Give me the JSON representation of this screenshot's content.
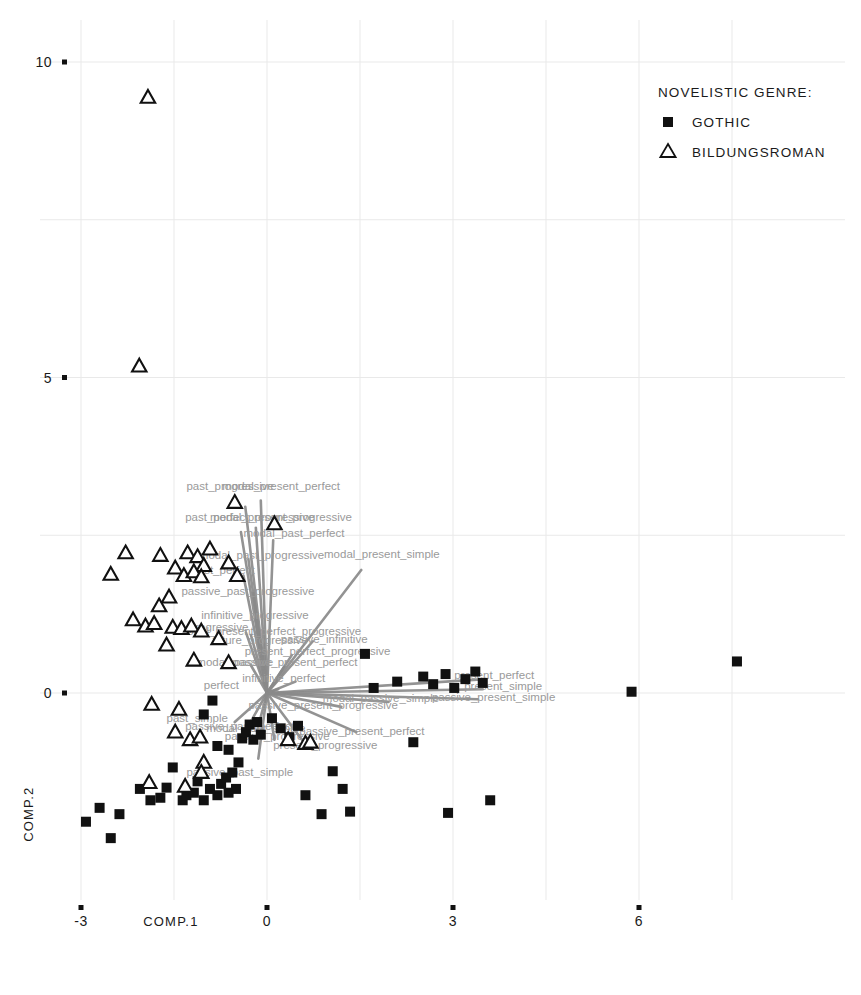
{
  "legend": {
    "title": "NOVELISTIC GENRE:",
    "entries": [
      {
        "label": "GOTHIC",
        "marker": "square-icon",
        "color": "#111111"
      },
      {
        "label": "BILDUNGSROMAN",
        "marker": "triangle-icon",
        "color": "#111111"
      }
    ]
  },
  "axes": {
    "x_title": "COMP.1",
    "y_title": "COMP.2",
    "x_ticks": [
      "-3",
      "0",
      "3",
      "6"
    ],
    "y_ticks": [
      "0",
      "5",
      "10"
    ]
  },
  "chart_data": {
    "type": "scatter",
    "title": "",
    "xlabel": "COMP.1",
    "ylabel": "COMP.2",
    "xlim": [
      -3.9,
      8.6
    ],
    "ylim": [
      -2.6,
      10.6
    ],
    "x_ticks": [
      -3,
      0,
      3,
      6
    ],
    "y_ticks": [
      0,
      5,
      10
    ],
    "grid": true,
    "legend_position": "top-right",
    "legend_title": "NOVELISTIC GENRE:",
    "series": [
      {
        "name": "GOTHIC",
        "marker": "square",
        "color": "#111111",
        "points": [
          [
            -2.7,
            -1.82
          ],
          [
            -2.92,
            -2.04
          ],
          [
            -2.38,
            -1.92
          ],
          [
            -2.52,
            -2.3
          ],
          [
            -2.05,
            -1.52
          ],
          [
            -1.88,
            -1.7
          ],
          [
            -1.72,
            -1.66
          ],
          [
            -1.62,
            -1.5
          ],
          [
            -1.52,
            -1.18
          ],
          [
            -1.36,
            -1.7
          ],
          [
            -1.3,
            -1.62
          ],
          [
            -1.18,
            -1.58
          ],
          [
            -1.12,
            -1.4
          ],
          [
            -1.02,
            -1.7
          ],
          [
            -0.92,
            -1.52
          ],
          [
            -0.8,
            -1.62
          ],
          [
            -0.74,
            -1.44
          ],
          [
            -0.66,
            -1.34
          ],
          [
            -0.62,
            -1.58
          ],
          [
            -0.56,
            -1.26
          ],
          [
            -0.5,
            -1.52
          ],
          [
            -0.46,
            -1.1
          ],
          [
            -0.4,
            -0.72
          ],
          [
            -0.34,
            -0.62
          ],
          [
            -0.28,
            -0.5
          ],
          [
            -0.22,
            -0.74
          ],
          [
            -0.16,
            -0.46
          ],
          [
            -0.1,
            -0.66
          ],
          [
            -0.62,
            -0.9
          ],
          [
            -0.8,
            -0.84
          ],
          [
            -1.02,
            -0.34
          ],
          [
            -0.88,
            -0.12
          ],
          [
            0.08,
            -0.4
          ],
          [
            0.22,
            -0.56
          ],
          [
            0.36,
            -0.7
          ],
          [
            0.5,
            -0.52
          ],
          [
            0.62,
            -1.62
          ],
          [
            0.88,
            -1.92
          ],
          [
            1.06,
            -1.24
          ],
          [
            1.22,
            -1.52
          ],
          [
            1.34,
            -1.88
          ],
          [
            1.58,
            0.62
          ],
          [
            1.72,
            0.08
          ],
          [
            2.1,
            0.18
          ],
          [
            2.52,
            0.26
          ],
          [
            2.68,
            0.14
          ],
          [
            2.88,
            0.3
          ],
          [
            3.02,
            0.08
          ],
          [
            3.2,
            0.22
          ],
          [
            3.36,
            0.34
          ],
          [
            3.48,
            0.16
          ],
          [
            2.36,
            -0.78
          ],
          [
            2.92,
            -1.9
          ],
          [
            3.6,
            -1.7
          ],
          [
            5.88,
            0.02
          ],
          [
            7.58,
            0.5
          ]
        ]
      },
      {
        "name": "BILDUNGSROMAN",
        "marker": "triangle",
        "color": "#111111",
        "points": [
          [
            -1.92,
            9.44
          ],
          [
            -2.06,
            5.18
          ],
          [
            -0.52,
            3.02
          ],
          [
            0.12,
            2.68
          ],
          [
            -2.28,
            2.22
          ],
          [
            -1.72,
            2.18
          ],
          [
            -2.52,
            1.88
          ],
          [
            -1.28,
            2.22
          ],
          [
            -1.12,
            2.16
          ],
          [
            -0.92,
            2.28
          ],
          [
            -1.02,
            2.02
          ],
          [
            -1.48,
            1.98
          ],
          [
            -1.34,
            1.86
          ],
          [
            -1.18,
            1.92
          ],
          [
            -1.06,
            1.84
          ],
          [
            -0.62,
            2.06
          ],
          [
            -0.48,
            1.86
          ],
          [
            -1.58,
            1.52
          ],
          [
            -1.74,
            1.38
          ],
          [
            -2.16,
            1.16
          ],
          [
            -1.96,
            1.06
          ],
          [
            -1.82,
            1.1
          ],
          [
            -1.52,
            1.04
          ],
          [
            -1.38,
            1.02
          ],
          [
            -1.22,
            1.06
          ],
          [
            -1.06,
            0.98
          ],
          [
            -0.78,
            0.86
          ],
          [
            -1.62,
            0.76
          ],
          [
            -1.18,
            0.52
          ],
          [
            -0.62,
            0.48
          ],
          [
            -1.86,
            -0.18
          ],
          [
            -1.42,
            -0.26
          ],
          [
            -1.48,
            -0.62
          ],
          [
            -1.24,
            -0.74
          ],
          [
            -1.08,
            -0.7
          ],
          [
            -1.02,
            -1.1
          ],
          [
            -1.06,
            -1.26
          ],
          [
            -1.9,
            -1.42
          ],
          [
            -1.32,
            -1.48
          ],
          [
            0.34,
            -0.74
          ],
          [
            0.62,
            -0.8
          ],
          [
            0.7,
            -0.78
          ]
        ]
      }
    ],
    "vectors": [
      {
        "label": "past_progressive",
        "x": -0.35,
        "y": 2.95,
        "label_x": -1.3,
        "label_y": 3.22
      },
      {
        "label": "modal_present_perfect",
        "x": -0.1,
        "y": 3.05,
        "label_x": -0.72,
        "label_y": 3.22
      },
      {
        "label": "past_perfect_progressive",
        "x": -0.42,
        "y": 2.55,
        "label_x": -1.32,
        "label_y": 2.72
      },
      {
        "label": "modal_present_progressive",
        "x": -0.18,
        "y": 2.62,
        "label_x": -0.92,
        "label_y": 2.72
      },
      {
        "label": "modal_past_perfect",
        "x": 0.1,
        "y": 2.42,
        "label_x": -0.38,
        "label_y": 2.48
      },
      {
        "label": "modal_past_progressive",
        "x": -0.3,
        "y": 2.12,
        "label_x": -1.1,
        "label_y": 2.12
      },
      {
        "label": "past_perfect",
        "x": -0.38,
        "y": 1.86,
        "label_x": -1.22,
        "label_y": 1.88
      },
      {
        "label": "passive_past_progressive",
        "x": -0.22,
        "y": 1.58,
        "label_x": -1.38,
        "label_y": 1.56
      },
      {
        "label": "infinitive_progressive",
        "x": -0.18,
        "y": 1.16,
        "label_x": -1.06,
        "label_y": 1.18
      },
      {
        "label": "modal_present_perfect_progressive",
        "x": -0.26,
        "y": 0.92,
        "label_x": -1.44,
        "label_y": 0.92
      },
      {
        "label": "progressive",
        "x": -0.34,
        "y": 0.96,
        "label_x": -1.26,
        "label_y": 0.98
      },
      {
        "label": "future_progressive",
        "x": -0.12,
        "y": 0.78,
        "label_x": -0.88,
        "label_y": 0.78
      },
      {
        "label": "passive_infinitive",
        "x": 0.74,
        "y": 0.82,
        "label_x": 0.22,
        "label_y": 0.8
      },
      {
        "label": "present_perfect_progressive",
        "x": 0.4,
        "y": 0.6,
        "label_x": -0.36,
        "label_y": 0.6
      },
      {
        "label": "modal_passive",
        "x": -0.26,
        "y": 0.44,
        "label_x": -1.14,
        "label_y": 0.42
      },
      {
        "label": "passive_present_perfect",
        "x": 0.28,
        "y": 0.42,
        "label_x": -0.56,
        "label_y": 0.42
      },
      {
        "label": "modal_present_simple",
        "x": 1.52,
        "y": 1.95,
        "label_x": 0.92,
        "label_y": 2.14
      },
      {
        "label": "infinitive_perfect",
        "x": 0.46,
        "y": 0.18,
        "label_x": -0.4,
        "label_y": 0.18
      },
      {
        "label": "perfect",
        "x": 0.18,
        "y": 0.06,
        "label_x": -1.02,
        "label_y": 0.06
      },
      {
        "label": "present_perfect",
        "x": 3.52,
        "y": 0.22,
        "label_x": 3.02,
        "label_y": 0.22
      },
      {
        "label": "present_simple",
        "x": 3.48,
        "y": 0.06,
        "label_x": 3.18,
        "label_y": 0.04
      },
      {
        "label": "passive_present_simple",
        "x": 3.4,
        "y": -0.1,
        "label_x": 2.66,
        "label_y": -0.12
      },
      {
        "label": "modal_passive_simple",
        "x": 1.96,
        "y": -0.14,
        "label_x": 0.9,
        "label_y": -0.14
      },
      {
        "label": "passive_present_progressive",
        "x": 1.2,
        "y": -0.22,
        "label_x": -0.3,
        "label_y": -0.26
      },
      {
        "label": "past_simple",
        "x": -0.52,
        "y": -0.46,
        "label_x": -1.62,
        "label_y": -0.46
      },
      {
        "label": "passive_past_perfect",
        "x": -0.3,
        "y": -0.52,
        "label_x": -1.32,
        "label_y": -0.58
      },
      {
        "label": "modal_past_simple",
        "x": -0.16,
        "y": -0.6,
        "label_x": -0.98,
        "label_y": -0.62
      },
      {
        "label": "passive_progressive",
        "x": 0.12,
        "y": -0.74,
        "label_x": -0.68,
        "label_y": -0.74
      },
      {
        "label": "passive_present_perfect_2",
        "x": 1.44,
        "y": -0.62,
        "label_x": 0.52,
        "label_y": -0.66
      },
      {
        "label": "present_progressive",
        "x": 0.64,
        "y": -0.84,
        "label_x": 0.1,
        "label_y": -0.88
      },
      {
        "label": "passive_past_simple",
        "x": -0.14,
        "y": -1.04,
        "label_x": -1.3,
        "label_y": -1.32
      }
    ]
  }
}
